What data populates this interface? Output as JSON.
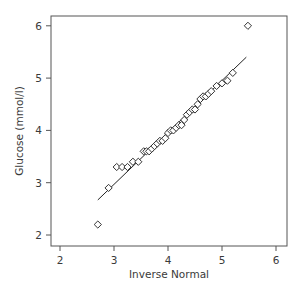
{
  "chart_data": {
    "type": "scatter",
    "title": "",
    "xlabel": "Inverse Normal",
    "ylabel": "Glucose (mmol/l)",
    "xlim": [
      1.8,
      6.2
    ],
    "ylim": [
      1.8,
      6.2
    ],
    "xticks": [
      2,
      3,
      4,
      5,
      6
    ],
    "yticks": [
      2,
      3,
      4,
      5,
      6
    ],
    "grid": false,
    "legend": null,
    "marker": "diamond-open",
    "series": [
      {
        "name": "Glucose quantiles",
        "points": [
          [
            2.7,
            2.2
          ],
          [
            2.9,
            2.9
          ],
          [
            3.05,
            3.3
          ],
          [
            3.15,
            3.3
          ],
          [
            3.25,
            3.3
          ],
          [
            3.35,
            3.4
          ],
          [
            3.45,
            3.4
          ],
          [
            3.55,
            3.6
          ],
          [
            3.6,
            3.6
          ],
          [
            3.65,
            3.6
          ],
          [
            3.7,
            3.65
          ],
          [
            3.75,
            3.7
          ],
          [
            3.8,
            3.75
          ],
          [
            3.85,
            3.8
          ],
          [
            3.9,
            3.8
          ],
          [
            3.95,
            3.85
          ],
          [
            4.0,
            3.95
          ],
          [
            4.05,
            4.0
          ],
          [
            4.1,
            4.0
          ],
          [
            4.15,
            4.05
          ],
          [
            4.2,
            4.1
          ],
          [
            4.25,
            4.1
          ],
          [
            4.3,
            4.2
          ],
          [
            4.35,
            4.3
          ],
          [
            4.4,
            4.35
          ],
          [
            4.45,
            4.4
          ],
          [
            4.5,
            4.4
          ],
          [
            4.55,
            4.5
          ],
          [
            4.6,
            4.6
          ],
          [
            4.65,
            4.65
          ],
          [
            4.7,
            4.65
          ],
          [
            4.75,
            4.7
          ],
          [
            4.8,
            4.75
          ],
          [
            4.9,
            4.85
          ],
          [
            5.0,
            4.9
          ],
          [
            5.1,
            4.95
          ],
          [
            5.2,
            5.1
          ],
          [
            5.48,
            6.0
          ]
        ]
      }
    ],
    "reference_line": {
      "x1": 2.7,
      "y1": 2.67,
      "x2": 5.45,
      "y2": 5.4
    }
  },
  "colors": {
    "axis": "#555555",
    "marker": "#333333",
    "line": "#222222",
    "text": "#3a3a3a"
  }
}
